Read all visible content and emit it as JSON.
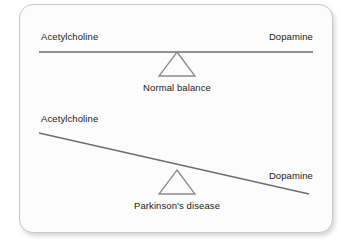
{
  "figure": {
    "credit": "Delmar/Cengage Learning",
    "background_color": "#ffffff",
    "card_color": "#fcfcfc",
    "card_border_color": "#c9c9c9",
    "beam_color": "#6e6e74",
    "fulcrum_color": "#8a8a90",
    "text_color": "#1b1b1b"
  },
  "chart_data": {
    "type": "diagram",
    "title": "",
    "subtitle": "",
    "xlabel": "",
    "ylabel": "",
    "legend": [],
    "grid": false,
    "panels": [
      {
        "id": "normal",
        "caption": "Normal balance",
        "left_label": "Acetylcholine",
        "right_label": "Dopamine",
        "tilt_degrees": 0,
        "tilt_direction": "level",
        "beam": {
          "x1": 39,
          "y1": 52,
          "x2": 313,
          "y2": 52
        },
        "fulcrum": {
          "cx": 177,
          "cy": 76,
          "half_width": 18,
          "height": 24
        },
        "left_value": 1.0,
        "right_value": 1.0
      },
      {
        "id": "parkinsons",
        "caption": "Parkinson's disease",
        "left_label": "Acetylcholine",
        "right_label": "Dopamine",
        "tilt_degrees": -12.6,
        "tilt_direction": "right-side-down",
        "beam": {
          "x1": 39,
          "y1": 133,
          "x2": 309,
          "y2": 194
        },
        "fulcrum": {
          "cx": 177,
          "cy": 194,
          "half_width": 18,
          "height": 24
        },
        "left_value": 1.0,
        "right_value": 0.4
      }
    ]
  }
}
